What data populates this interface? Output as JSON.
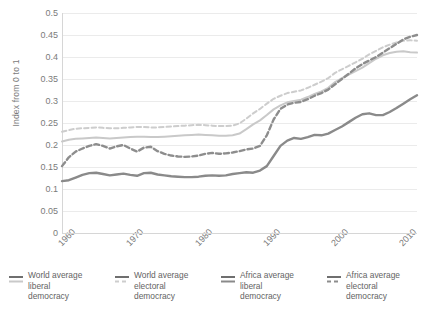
{
  "chart_data": {
    "type": "line",
    "title": "",
    "xlabel": "",
    "ylabel": "Index from 0 to 1",
    "xlim": [
      1960,
      2012
    ],
    "ylim": [
      0,
      0.5
    ],
    "grid": true,
    "legend_position": "bottom",
    "yticks": [
      "0",
      "0.05",
      "0.1",
      "0.15",
      "0.2",
      "0.25",
      "0.3",
      "0.35",
      "0.4",
      "0.45",
      "0.5"
    ],
    "ytick_values": [
      0,
      0.05,
      0.1,
      0.15,
      0.2,
      0.25,
      0.3,
      0.35,
      0.4,
      0.45,
      0.5
    ],
    "xticks": [
      "1960",
      "1970",
      "1980",
      "1990",
      "2000",
      "2010"
    ],
    "xtick_values": [
      1960,
      1970,
      1980,
      1990,
      2000,
      2010
    ],
    "x": [
      1960,
      1961,
      1962,
      1963,
      1964,
      1965,
      1966,
      1967,
      1968,
      1969,
      1970,
      1971,
      1972,
      1973,
      1974,
      1975,
      1976,
      1977,
      1978,
      1979,
      1980,
      1981,
      1982,
      1983,
      1984,
      1985,
      1986,
      1987,
      1988,
      1989,
      1990,
      1991,
      1992,
      1993,
      1994,
      1995,
      1996,
      1997,
      1998,
      1999,
      2000,
      2001,
      2002,
      2003,
      2004,
      2005,
      2006,
      2007,
      2008,
      2009,
      2010,
      2011,
      2012
    ],
    "series": [
      {
        "name": "World average liberal democracy",
        "color": "#c9c9c9",
        "style": "solid",
        "width": 2.0,
        "values": [
          0.208,
          0.212,
          0.214,
          0.215,
          0.216,
          0.217,
          0.216,
          0.215,
          0.216,
          0.217,
          0.218,
          0.219,
          0.219,
          0.218,
          0.218,
          0.219,
          0.22,
          0.221,
          0.222,
          0.223,
          0.224,
          0.223,
          0.222,
          0.221,
          0.221,
          0.222,
          0.226,
          0.236,
          0.247,
          0.256,
          0.268,
          0.281,
          0.29,
          0.297,
          0.3,
          0.303,
          0.309,
          0.316,
          0.322,
          0.33,
          0.343,
          0.352,
          0.36,
          0.368,
          0.376,
          0.386,
          0.396,
          0.404,
          0.409,
          0.412,
          0.413,
          0.411,
          0.41
        ]
      },
      {
        "name": "World average electoral democracy",
        "color": "#cdcdcd",
        "style": "dashed",
        "width": 2.0,
        "values": [
          0.23,
          0.234,
          0.237,
          0.238,
          0.239,
          0.24,
          0.239,
          0.238,
          0.238,
          0.239,
          0.24,
          0.241,
          0.241,
          0.24,
          0.24,
          0.241,
          0.242,
          0.243,
          0.244,
          0.245,
          0.246,
          0.245,
          0.244,
          0.243,
          0.243,
          0.244,
          0.249,
          0.26,
          0.272,
          0.282,
          0.294,
          0.305,
          0.312,
          0.318,
          0.321,
          0.324,
          0.33,
          0.337,
          0.344,
          0.352,
          0.364,
          0.372,
          0.38,
          0.388,
          0.396,
          0.406,
          0.414,
          0.422,
          0.428,
          0.433,
          0.437,
          0.438,
          0.437
        ]
      },
      {
        "name": "Africa average liberal democracy",
        "color": "#8a8a8a",
        "style": "solid",
        "width": 2.4,
        "values": [
          0.118,
          0.12,
          0.126,
          0.132,
          0.136,
          0.137,
          0.134,
          0.131,
          0.133,
          0.135,
          0.132,
          0.13,
          0.136,
          0.137,
          0.133,
          0.131,
          0.129,
          0.128,
          0.127,
          0.127,
          0.128,
          0.13,
          0.131,
          0.13,
          0.131,
          0.134,
          0.136,
          0.138,
          0.137,
          0.142,
          0.152,
          0.175,
          0.198,
          0.21,
          0.216,
          0.214,
          0.218,
          0.223,
          0.222,
          0.226,
          0.234,
          0.242,
          0.252,
          0.262,
          0.27,
          0.272,
          0.268,
          0.268,
          0.275,
          0.284,
          0.294,
          0.304,
          0.313
        ]
      },
      {
        "name": "Africa average electoral democracy",
        "color": "#8d8d8d",
        "style": "dashed",
        "width": 2.4,
        "values": [
          0.152,
          0.172,
          0.185,
          0.192,
          0.198,
          0.202,
          0.198,
          0.192,
          0.197,
          0.2,
          0.192,
          0.185,
          0.194,
          0.196,
          0.186,
          0.18,
          0.176,
          0.174,
          0.173,
          0.174,
          0.176,
          0.18,
          0.182,
          0.18,
          0.181,
          0.183,
          0.186,
          0.19,
          0.192,
          0.198,
          0.222,
          0.258,
          0.282,
          0.292,
          0.296,
          0.298,
          0.304,
          0.312,
          0.318,
          0.326,
          0.338,
          0.35,
          0.362,
          0.374,
          0.384,
          0.392,
          0.4,
          0.41,
          0.42,
          0.43,
          0.44,
          0.446,
          0.45
        ]
      }
    ]
  },
  "legend": {
    "items": [
      {
        "label": "World average\nliberal\ndemocracy",
        "color": "#c9c9c9",
        "style": "solid"
      },
      {
        "label": "World average\nelectoral\ndemocracy",
        "color": "#cdcdcd",
        "style": "dashed"
      },
      {
        "label": "Africa average\nliberal\ndemocracy",
        "color": "#8a8a8a",
        "style": "solid"
      },
      {
        "label": "Africa average\nelectoral\ndemocracy",
        "color": "#8d8d8d",
        "style": "dashed"
      }
    ]
  },
  "style": {
    "grid_color": "#ebebeb",
    "axis_color": "#d6d6d6",
    "tick_text_color": "#7b7b7b"
  }
}
